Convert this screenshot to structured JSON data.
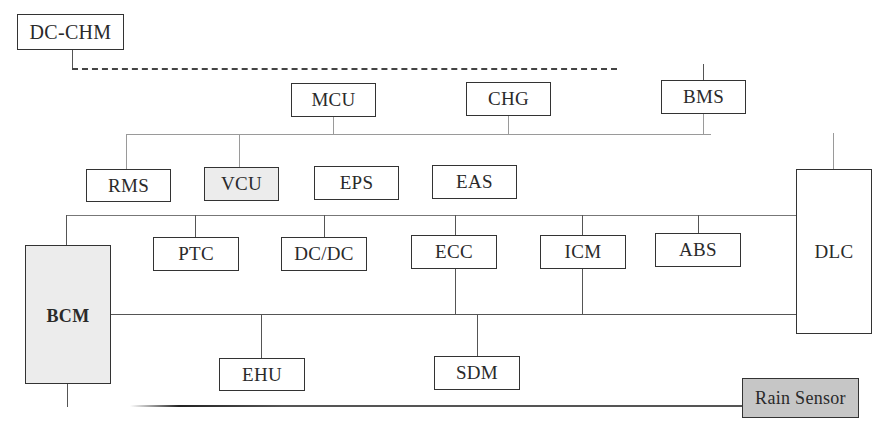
{
  "diagram": {
    "type": "vehicle-network-topology",
    "nodes": {
      "dc_chm": {
        "label": "DC-CHM"
      },
      "mcu": {
        "label": "MCU"
      },
      "chg": {
        "label": "CHG"
      },
      "bms": {
        "label": "BMS"
      },
      "rms": {
        "label": "RMS"
      },
      "vcu": {
        "label": "VCU"
      },
      "eps": {
        "label": "EPS"
      },
      "eas": {
        "label": "EAS"
      },
      "dlc": {
        "label": "DLC"
      },
      "bcm": {
        "label": "BCM"
      },
      "ptc": {
        "label": "PTC"
      },
      "dcdc": {
        "label": "DC/DC"
      },
      "ecc": {
        "label": "ECC"
      },
      "icm": {
        "label": "ICM"
      },
      "abs": {
        "label": "ABS"
      },
      "ehu": {
        "label": "EHU"
      },
      "sdm": {
        "label": "SDM"
      },
      "rain_sensor": {
        "label": "Rain Sensor"
      }
    },
    "colors": {
      "line": "#555555",
      "box_border": "#333333",
      "vcu_fill": "#ececec",
      "bcm_fill": "#ececec",
      "rain_sensor_fill": "#c6c6c6"
    },
    "connections": [
      {
        "from": "DC-CHM",
        "to": "BMS",
        "style": "dash-dot"
      },
      {
        "bus": "powertrain",
        "members": [
          "RMS",
          "VCU",
          "MCU",
          "CHG",
          "BMS",
          "DLC"
        ]
      },
      {
        "bus": "body-upper",
        "members": [
          "BCM",
          "PTC",
          "DC/DC",
          "ECC",
          "ICM",
          "ABS",
          "DLC"
        ]
      },
      {
        "bus": "body-lower",
        "members": [
          "BCM",
          "EHU",
          "ECC",
          "SDM",
          "ICM",
          "DLC"
        ]
      },
      {
        "bus": "lin",
        "members": [
          "BCM",
          "Rain Sensor"
        ]
      }
    ]
  }
}
